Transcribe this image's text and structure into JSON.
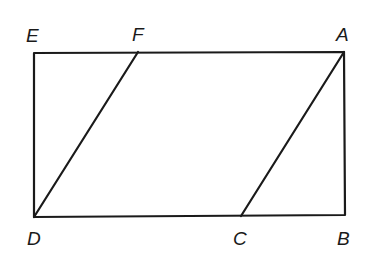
{
  "diagram": {
    "type": "geometry",
    "points": {
      "E": {
        "label": "E",
        "x": 34,
        "y": 53
      },
      "F": {
        "label": "F",
        "x": 138,
        "y": 52
      },
      "A": {
        "label": "A",
        "x": 344,
        "y": 52
      },
      "D": {
        "label": "D",
        "x": 34,
        "y": 217
      },
      "C": {
        "label": "C",
        "x": 241,
        "y": 216
      },
      "B": {
        "label": "B",
        "x": 345,
        "y": 215
      }
    },
    "segments": [
      [
        "E",
        "A"
      ],
      [
        "A",
        "B"
      ],
      [
        "B",
        "D"
      ],
      [
        "D",
        "E"
      ],
      [
        "D",
        "F"
      ],
      [
        "C",
        "A"
      ]
    ],
    "labels": {
      "E": "E",
      "F": "F",
      "A": "A",
      "D": "D",
      "C": "C",
      "B": "B"
    }
  }
}
